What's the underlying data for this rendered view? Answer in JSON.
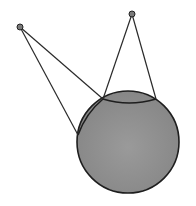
{
  "diagram": {
    "colors": {
      "background": "#ffffff",
      "sphere_fill": "#8a8a8a",
      "sphere_stroke": "#1e1e1e",
      "line": "#2a2a2a",
      "point_fill": "#7a7a7a"
    },
    "sphere": {
      "cx": 128,
      "cy": 142,
      "r": 51
    },
    "point_sources": [
      {
        "id": "left",
        "x": 20,
        "y": 27,
        "r": 3
      },
      {
        "id": "right",
        "x": 132,
        "y": 14,
        "r": 3
      }
    ],
    "tangent_lines": [
      {
        "from": "left",
        "x1": 20,
        "y1": 27,
        "x2": 78,
        "y2": 135
      },
      {
        "from": "left",
        "x1": 20,
        "y1": 27,
        "x2": 103,
        "y2": 99
      },
      {
        "from": "right",
        "x1": 132,
        "y1": 14,
        "x2": 103,
        "y2": 99
      },
      {
        "from": "right",
        "x1": 132,
        "y1": 14,
        "x2": 156,
        "y2": 99
      }
    ],
    "contact_arcs": [
      {
        "from": "left",
        "d": "M 78 135 Q 86 113 103 99"
      },
      {
        "from": "right",
        "d": "M 103 99 Q 129 107 156 99"
      }
    ]
  }
}
